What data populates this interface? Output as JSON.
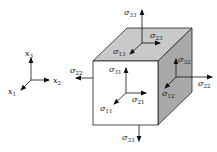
{
  "diagram": {
    "colors": {
      "front_face": "#ffffff",
      "top_face": "#c9c9c9",
      "right_face": "#a9a9a9",
      "edge": "#222222",
      "arrow": "#111111"
    },
    "coordinate_axes": {
      "x1": {
        "symbol": "x",
        "sub": "1"
      },
      "x2": {
        "symbol": "x",
        "sub": "2"
      },
      "x3": {
        "symbol": "x",
        "sub": "3"
      }
    },
    "stresses": {
      "top_normal": {
        "symbol": "σ",
        "sub": "33"
      },
      "top_shear_2": {
        "symbol": "σ",
        "sub": "23"
      },
      "top_shear_1": {
        "symbol": "σ",
        "sub": "13"
      },
      "front_shear_3": {
        "symbol": "σ",
        "sub": "31"
      },
      "front_shear_2": {
        "symbol": "σ",
        "sub": "21"
      },
      "front_normal": {
        "symbol": "σ",
        "sub": "11"
      },
      "right_shear_3": {
        "symbol": "σ",
        "sub": "32"
      },
      "right_normal": {
        "symbol": "σ",
        "sub": "22"
      },
      "right_shear_1": {
        "symbol": "σ",
        "sub": "12"
      },
      "left_normal": {
        "symbol": "σ",
        "sub": "22"
      },
      "bottom_normal": {
        "symbol": "σ",
        "sub": "33"
      }
    }
  }
}
